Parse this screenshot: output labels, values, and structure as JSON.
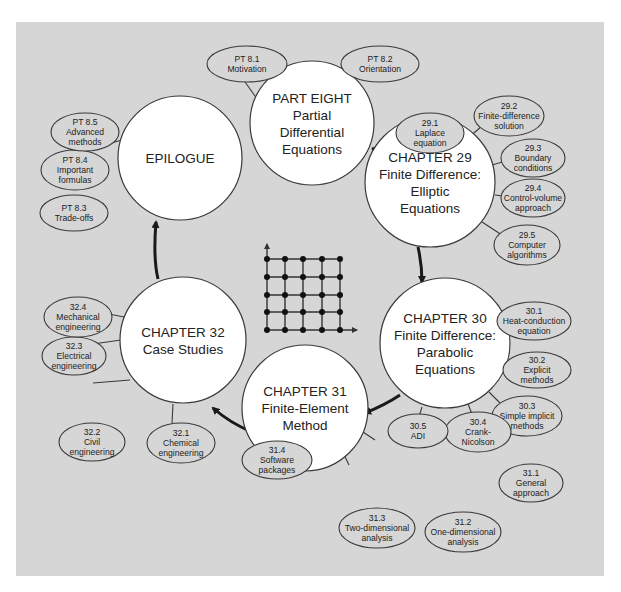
{
  "diagram": {
    "center_icon": "finite-difference-grid-icon",
    "nodes": [
      {
        "id": "part8",
        "lines": [
          "PART EIGHT",
          "Partial",
          "Differential",
          "Equations"
        ],
        "topics": [
          {
            "num": "PT 8.1",
            "lines": [
              "Motivation"
            ]
          },
          {
            "num": "PT 8.2",
            "lines": [
              "Orientation"
            ]
          }
        ]
      },
      {
        "id": "ch29",
        "lines": [
          "CHAPTER 29",
          "Finite Difference:",
          "Elliptic",
          "Equations"
        ],
        "topics": [
          {
            "num": "29.1",
            "lines": [
              "Laplace",
              "equation"
            ]
          },
          {
            "num": "29.2",
            "lines": [
              "Finite-difference",
              "solution"
            ]
          },
          {
            "num": "29.3",
            "lines": [
              "Boundary",
              "conditions"
            ]
          },
          {
            "num": "29.4",
            "lines": [
              "Control-volume",
              "approach"
            ]
          },
          {
            "num": "29.5",
            "lines": [
              "Computer",
              "algorithms"
            ]
          }
        ]
      },
      {
        "id": "ch30",
        "lines": [
          "CHAPTER 30",
          "Finite Difference:",
          "Parabolic",
          "Equations"
        ],
        "topics": [
          {
            "num": "30.1",
            "lines": [
              "Heat-conduction",
              "equation"
            ]
          },
          {
            "num": "30.2",
            "lines": [
              "Explicit",
              "methods"
            ]
          },
          {
            "num": "30.3",
            "lines": [
              "Simple implicit",
              "methods"
            ]
          },
          {
            "num": "30.4",
            "lines": [
              "Crank-",
              "Nicolson"
            ]
          },
          {
            "num": "30.5",
            "lines": [
              "ADI"
            ]
          }
        ]
      },
      {
        "id": "ch31",
        "lines": [
          "CHAPTER 31",
          "Finite-Element",
          "Method"
        ],
        "topics": [
          {
            "num": "31.1",
            "lines": [
              "General",
              "approach"
            ]
          },
          {
            "num": "31.2",
            "lines": [
              "One-dimensional",
              "analysis"
            ]
          },
          {
            "num": "31.3",
            "lines": [
              "Two-dimensional",
              "analysis"
            ]
          },
          {
            "num": "31.4",
            "lines": [
              "Software",
              "packages"
            ]
          }
        ]
      },
      {
        "id": "ch32",
        "lines": [
          "CHAPTER 32",
          "Case Studies"
        ],
        "topics": [
          {
            "num": "32.1",
            "lines": [
              "Chemical",
              "engineering"
            ]
          },
          {
            "num": "32.2",
            "lines": [
              "Civil",
              "engineering"
            ]
          },
          {
            "num": "32.3",
            "lines": [
              "Electrical",
              "engineering"
            ]
          },
          {
            "num": "32.4",
            "lines": [
              "Mechanical",
              "engineering"
            ]
          }
        ]
      },
      {
        "id": "epilogue",
        "lines": [
          "EPILOGUE"
        ],
        "topics": [
          {
            "num": "PT 8.3",
            "lines": [
              "Trade-offs"
            ]
          },
          {
            "num": "PT 8.4",
            "lines": [
              "Important",
              "formulas"
            ]
          },
          {
            "num": "PT 8.5",
            "lines": [
              "Advanced",
              "methods"
            ]
          }
        ]
      }
    ]
  }
}
